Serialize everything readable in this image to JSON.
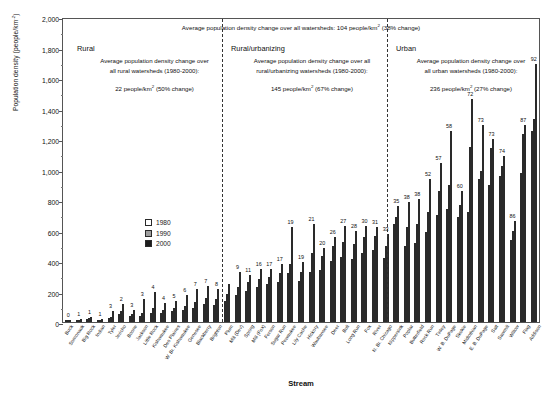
{
  "chart_data": {
    "type": "bar",
    "title": "",
    "xlabel": "Stream",
    "ylabel": "Population density (people/km²)",
    "ylim": [
      0,
      2000
    ],
    "ytick_labels": [
      "0",
      "200",
      "400",
      "600",
      "800",
      "1,000",
      "1,200",
      "1,400",
      "1,600",
      "1,800",
      "2,000"
    ],
    "ytick_values": [
      0,
      200,
      400,
      600,
      800,
      1000,
      1200,
      1400,
      1600,
      1800,
      2000
    ],
    "grid": false,
    "legend_position": "inside-left",
    "series": [
      {
        "name": "1980",
        "color": "#ffffff"
      },
      {
        "name": "1990",
        "color": "#9e9e9e"
      },
      {
        "name": "2000",
        "color": "#1d1d1d"
      }
    ],
    "categories": [
      "Buck",
      "Somonauk",
      "Big Rock",
      "Indian",
      "Tyler",
      "Jericho",
      "Boone",
      "Jackson",
      "Little Rock",
      "Kishwaukee",
      "Des Plaines",
      "W. Br. Kishwaukee",
      "Genesee",
      "Blackberry",
      "Brighton",
      "Plum",
      "Mill (Dev)",
      "Spring",
      "Mill (Fox)",
      "Ferson",
      "Sugar Run",
      "Pewaukee",
      "Lily Cache",
      "Hickory",
      "Waubansee",
      "Deer",
      "Bull",
      "Long Run",
      "Fox",
      "River",
      "N. Br. Chicago",
      "Nippersink",
      "Poplar",
      "Butterfield",
      "Rock Run",
      "Tinley",
      "W. B. DuPage",
      "Skokie",
      "Midlothian",
      "E. B. DuPage",
      "Salt",
      "Sawmill",
      "Willow",
      "Flag",
      "Addison"
    ],
    "group_labels": [
      "0",
      "1",
      "1",
      "1",
      "3",
      "2",
      "3",
      "3",
      "4",
      "4",
      "5",
      "6",
      "7",
      "7",
      "8",
      "",
      "9",
      "11",
      "16",
      "17",
      "17",
      "19",
      "19",
      "21",
      "20",
      "26",
      "27",
      "28",
      "30",
      "31",
      "33",
      "35",
      "38",
      "38",
      "52",
      "57",
      "58",
      "60",
      "72",
      "73",
      "73",
      "74",
      "86",
      "87",
      "92"
    ],
    "values_1980": [
      8,
      12,
      18,
      10,
      24,
      55,
      38,
      42,
      58,
      62,
      70,
      78,
      92,
      118,
      110,
      140,
      175,
      205,
      230,
      250,
      265,
      320,
      270,
      330,
      340,
      400,
      425,
      415,
      450,
      470,
      420,
      640,
      500,
      520,
      590,
      700,
      740,
      690,
      720,
      940,
      900,
      960,
      540,
      980,
      1255
    ],
    "values_1990": [
      10,
      16,
      24,
      12,
      34,
      72,
      50,
      60,
      95,
      80,
      95,
      108,
      128,
      160,
      150,
      185,
      230,
      265,
      285,
      295,
      320,
      380,
      330,
      455,
      430,
      500,
      525,
      510,
      560,
      565,
      500,
      690,
      620,
      640,
      720,
      860,
      900,
      770,
      1150,
      990,
      1140,
      1020,
      600,
      1230,
      1330
    ],
    "values_2000": [
      12,
      22,
      33,
      18,
      72,
      120,
      78,
      150,
      200,
      122,
      140,
      175,
      215,
      235,
      215,
      250,
      330,
      310,
      345,
      350,
      380,
      620,
      395,
      640,
      485,
      560,
      630,
      600,
      630,
      625,
      580,
      760,
      790,
      805,
      940,
      1040,
      1250,
      860,
      1460,
      1290,
      1200,
      1090,
      660,
      1290,
      1690
    ],
    "annotations": {
      "overall": "Average population density change over all watersheds:  104 people/km² (38% change)",
      "sections": [
        {
          "heading": "Rural",
          "line1": "Average population density change over",
          "line2": "all rural watersheds (1980-2000):",
          "value": "22 people/km² (50% change)"
        },
        {
          "heading": "Rural/urbanizing",
          "line1": "Average population density change over all",
          "line2": "rural/urbanizing watersheds (1980-2000):",
          "value": "145 people/km² (67% change)"
        },
        {
          "heading": "Urban",
          "line1": "Average population density change over",
          "line2": "all urban watersheds (1980-2000):",
          "value": "236 people/km² (27% change)"
        }
      ]
    }
  }
}
